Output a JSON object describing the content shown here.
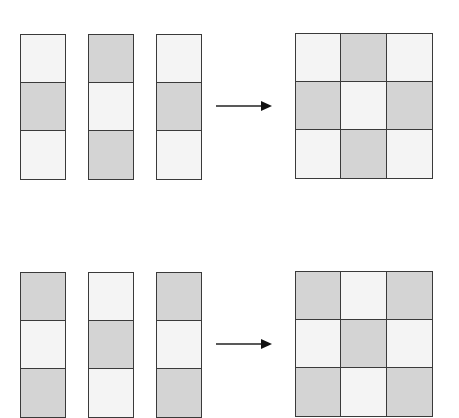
{
  "colors": {
    "light": "#f4f4f4",
    "dark": "#d4d4d4",
    "stroke": "#3a3a3a"
  },
  "rows": [
    {
      "columns": [
        [
          "light",
          "dark",
          "light"
        ],
        [
          "dark",
          "light",
          "dark"
        ],
        [
          "light",
          "dark",
          "light"
        ]
      ],
      "grid": [
        [
          "light",
          "dark",
          "light"
        ],
        [
          "dark",
          "light",
          "dark"
        ],
        [
          "light",
          "dark",
          "light"
        ]
      ]
    },
    {
      "columns": [
        [
          "dark",
          "light",
          "dark"
        ],
        [
          "light",
          "dark",
          "light"
        ],
        [
          "dark",
          "light",
          "dark"
        ]
      ],
      "grid": [
        [
          "dark",
          "light",
          "dark"
        ],
        [
          "light",
          "dark",
          "light"
        ],
        [
          "dark",
          "light",
          "dark"
        ]
      ]
    }
  ]
}
